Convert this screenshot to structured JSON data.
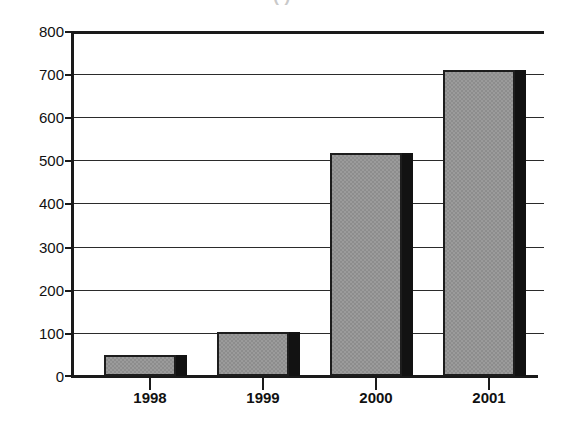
{
  "chart_data": {
    "type": "bar",
    "title": "",
    "title_partial": "( )",
    "xlabel": "",
    "ylabel": "",
    "categories": [
      "1998",
      "1999",
      "2000",
      "2001"
    ],
    "values": [
      48,
      103,
      518,
      710
    ],
    "series": [
      {
        "name": "",
        "values": [
          48,
          103,
          518,
          710
        ]
      }
    ],
    "ylim": [
      0,
      800
    ],
    "ytick_labels": [
      "800",
      "700",
      "600",
      "500",
      "400",
      "300",
      "200",
      "100",
      "0"
    ],
    "ytick_values": [
      800,
      700,
      600,
      500,
      400,
      300,
      200,
      100,
      0
    ],
    "ytick_step": 100,
    "grid": true,
    "grid_axis": "y",
    "legend": false,
    "legend_position": "none",
    "bar_style": "3d-shadow",
    "colors": {
      "bar_face": "#9b9b9b",
      "bar_side": "#121212",
      "bar_outline": "#1d1d1d",
      "axis": "#1a1a1a",
      "grid": "#2b2b2b",
      "text": "#111111",
      "background": "#ffffff"
    }
  }
}
